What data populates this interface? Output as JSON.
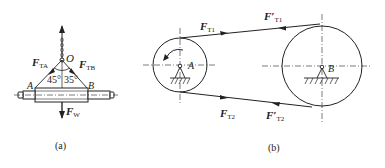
{
  "figure_a": {
    "caption": "(a)",
    "point_o": "O",
    "point_a": "A",
    "point_b": "B",
    "angle_left": "45°",
    "angle_right": "35°",
    "force_ta": {
      "main": "F",
      "sub": "TA"
    },
    "force_tb": {
      "main": "F",
      "sub": "TB"
    },
    "force_w": {
      "main": "F",
      "sub": "W"
    }
  },
  "figure_b": {
    "caption": "(b)",
    "point_a": "A",
    "point_b": "B",
    "force_t1": {
      "main": "F",
      "sub": "T1"
    },
    "force_t1_prime": {
      "main": "F′",
      "sub": "T1"
    },
    "force_t2": {
      "main": "F",
      "sub": "T2"
    },
    "force_t2_prime": {
      "main": "F′",
      "sub": "T2"
    }
  }
}
